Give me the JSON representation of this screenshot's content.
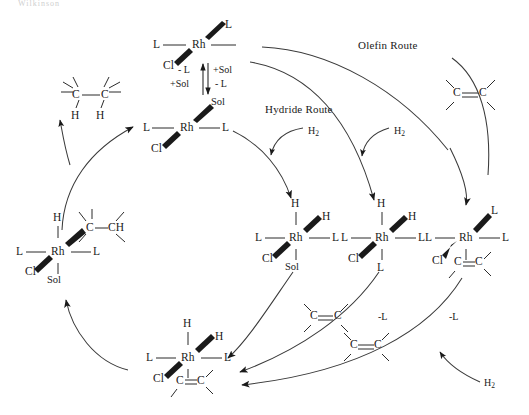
{
  "diagram": {
    "top_partial_text": "Wilkinson",
    "background_color": "#ffffff",
    "line_color": "#1a1a1a"
  },
  "route_labels": {
    "olefin": "Olefin Route",
    "hydride": "Hydride Route"
  },
  "reaction_labels": {
    "minus_l": "- L",
    "plus_sol": "+Sol",
    "plus_sol_2": "+Sol",
    "minus_l_2": "- L",
    "h2_a": "H",
    "h2_a_sub": "2",
    "h2_b": "H",
    "h2_b_sub": "2",
    "h2_c": "H",
    "h2_c_sub": "2",
    "minus_l_3": "-L",
    "minus_l_4": "-L"
  },
  "atoms": {
    "Rh": "Rh",
    "Cl": "Cl",
    "L": "L",
    "H": "H",
    "Sol": "Sol",
    "C": "C",
    "CH": "CH"
  },
  "species": [
    {
      "id": "rhcl-l3",
      "name": "RhCl(L)3 vacant site complex",
      "center": "Rh",
      "ligands": [
        "L",
        "L",
        "Cl",
        "vacant"
      ]
    },
    {
      "id": "rhcl-l2-sol",
      "name": "RhCl(L)2(Sol) solvate complex",
      "center": "Rh",
      "ligands": [
        "L",
        "L",
        "Cl",
        "Sol"
      ]
    },
    {
      "id": "dihydride-sol",
      "name": "RhH2Cl(L)2(Sol) dihydride solvate",
      "center": "Rh",
      "ligands": [
        "H",
        "H",
        "L",
        "L",
        "Cl",
        "Sol"
      ]
    },
    {
      "id": "dihydride-l3",
      "name": "RhH2Cl(L)3 dihydride",
      "center": "Rh",
      "ligands": [
        "H",
        "H",
        "L",
        "L",
        "Cl",
        "L"
      ]
    },
    {
      "id": "olefin-l3",
      "name": "RhCl(L)3(olefin) complex",
      "center": "Rh",
      "ligands": [
        "L",
        "L",
        "L",
        "Cl",
        "C=C"
      ]
    },
    {
      "id": "dihydride-olefin",
      "name": "RhH2Cl(L)2(olefin) complex",
      "center": "Rh",
      "ligands": [
        "H",
        "H",
        "L",
        "L",
        "Cl",
        "C=C"
      ]
    },
    {
      "id": "alkyl-hydride",
      "name": "Alkyl hydride RhHCl(alkyl)(L)2(Sol)",
      "center": "Rh",
      "ligands": [
        "H",
        "C-CH",
        "L",
        "L",
        "Cl",
        "Sol"
      ]
    }
  ],
  "free_molecules": [
    {
      "id": "alkane-product",
      "label_left": "C",
      "label_right": "C",
      "h_left": "H",
      "h_right": "H"
    },
    {
      "id": "alkene-topright",
      "label_left": "C",
      "label_right": "C"
    },
    {
      "id": "alkene-mid",
      "label_left": "C",
      "label_right": "C"
    },
    {
      "id": "alkene-low",
      "label_left": "C",
      "label_right": "C"
    }
  ]
}
